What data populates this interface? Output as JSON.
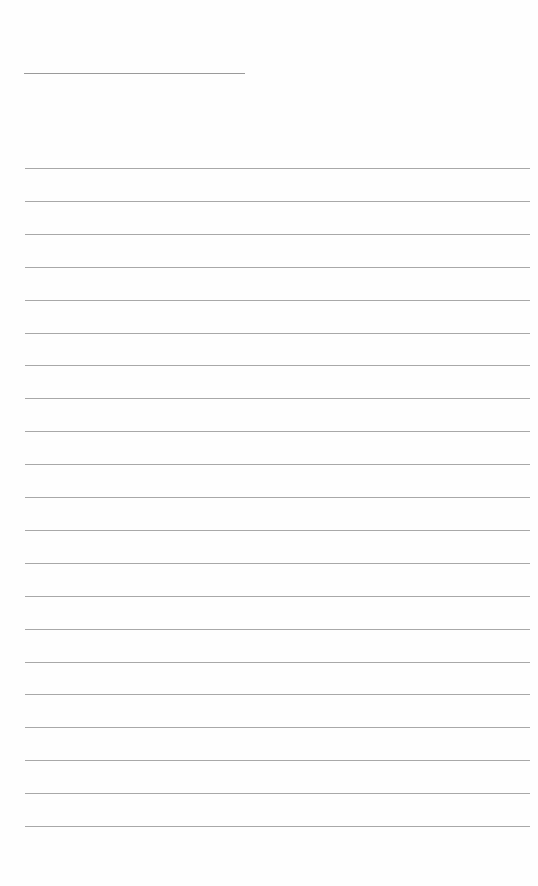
{
  "page": {
    "type": "lined-paper",
    "background": "#ffffff",
    "line_color": "#a8a8a8",
    "header_line": {
      "x": 24,
      "y": 73,
      "width": 221
    },
    "rules": {
      "count": 21,
      "first_y": 168,
      "spacing": 32.9,
      "x": 25,
      "width": 505
    }
  }
}
